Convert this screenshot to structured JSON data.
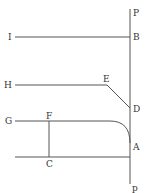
{
  "diagram": {
    "labels": {
      "P_top": "P",
      "B": "B",
      "I": "I",
      "H": "H",
      "E": "E",
      "D": "D",
      "G": "G",
      "F": "F",
      "A": "A",
      "C": "C",
      "p_bottom": "p"
    },
    "colors": {
      "line": "#555555",
      "text": "#333333",
      "background": "#ffffff"
    }
  }
}
